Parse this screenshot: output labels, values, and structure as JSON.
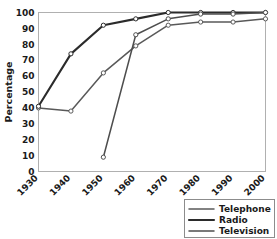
{
  "chart_data": {
    "type": "line",
    "title": "",
    "xlabel": "",
    "ylabel": "Percentage",
    "categories": [
      "1930",
      "1940",
      "1950",
      "1960",
      "1970",
      "1980",
      "1990",
      "2000"
    ],
    "x": [
      1930,
      1940,
      1950,
      1960,
      1970,
      1980,
      1990,
      2000
    ],
    "xlim": [
      1930,
      2000
    ],
    "ylim": [
      0,
      100
    ],
    "yticks": [
      0,
      10,
      20,
      30,
      40,
      50,
      60,
      70,
      80,
      90,
      100
    ],
    "ytick_labels": [
      "0",
      "10",
      "20",
      "30",
      "40",
      "50",
      "60",
      "70",
      "80",
      "90",
      "100"
    ],
    "xtick_labels": [
      "1930",
      "1940",
      "1950",
      "1960",
      "1970",
      "1980",
      "1990",
      "2000"
    ],
    "grid": true,
    "legend_position": "bottom-right",
    "markers": "open-circle",
    "series": [
      {
        "name": "Telephone",
        "color": "#595959",
        "x": [
          1930,
          1940,
          1950,
          1960,
          1970,
          1980,
          1990,
          2000
        ],
        "values": [
          40,
          38,
          62,
          79,
          92,
          94,
          94,
          96
        ]
      },
      {
        "name": "Radio",
        "color": "#2b2b2b",
        "x": [
          1930,
          1940,
          1950,
          1960,
          1970,
          1980,
          1990,
          2000
        ],
        "values": [
          41,
          74,
          92,
          96,
          100,
          100,
          100,
          100
        ]
      },
      {
        "name": "Television",
        "color": "#4d4d4d",
        "x": [
          1950,
          1960,
          1970,
          1980,
          1990,
          2000
        ],
        "values": [
          9,
          86,
          96,
          99,
          99,
          100
        ]
      }
    ],
    "legend_entries": [
      {
        "label": "Telephone",
        "color": "#595959"
      },
      {
        "label": "Radio",
        "color": "#2b2b2b"
      },
      {
        "label": "Television",
        "color": "#4d4d4d"
      }
    ]
  }
}
